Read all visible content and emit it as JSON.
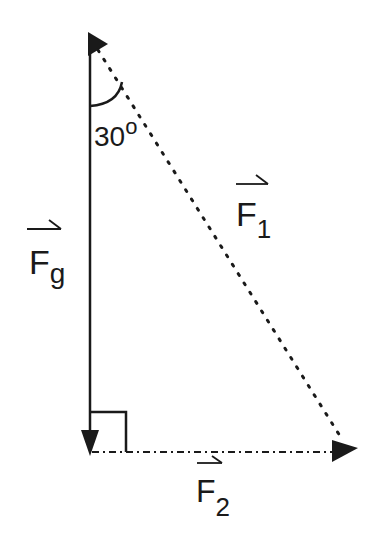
{
  "diagram": {
    "type": "force-vector-triangle",
    "vectors": [
      {
        "id": "Fg",
        "label": "F",
        "subscript": "g",
        "style": "solid",
        "direction": "down",
        "from": [
          90,
          40
        ],
        "to": [
          90,
          452
        ]
      },
      {
        "id": "F1",
        "label": "F",
        "subscript": "1",
        "style": "dotted",
        "direction": "diagonal-down-right",
        "from": [
          90,
          40
        ],
        "to": [
          355,
          452
        ]
      },
      {
        "id": "F2",
        "label": "F",
        "subscript": "2",
        "style": "dash-dot",
        "direction": "right",
        "from": [
          90,
          452
        ],
        "to": [
          355,
          452
        ]
      }
    ],
    "angle": {
      "value": "30",
      "unit": "o",
      "between": [
        "Fg",
        "F1"
      ]
    },
    "right_angle_marker": {
      "between": [
        "Fg",
        "F2"
      ]
    },
    "colors": {
      "ink": "#1a1a1a",
      "background": "#ffffff"
    }
  },
  "labels": {
    "fg_main": "F",
    "fg_sub": "g",
    "f1_main": "F",
    "f1_sub": "1",
    "f2_main": "F",
    "f2_sub": "2",
    "angle_value": "30",
    "angle_degree": "o"
  }
}
